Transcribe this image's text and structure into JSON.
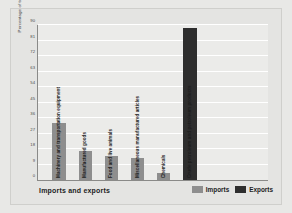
{
  "chart_data": {
    "type": "bar",
    "title": "",
    "xlabel": "Imports and exports",
    "ylabel": "Percentage of total",
    "ylim": [
      0,
      90
    ],
    "yticks": [
      0,
      9,
      18,
      27,
      36,
      45,
      54,
      63,
      72,
      81,
      90
    ],
    "grid": true,
    "legend_position": "bottom-right",
    "legend": [
      "Imports",
      "Exports"
    ],
    "categories": [
      "Machinery and transportation equipment",
      "Manufactured goods",
      "Food and live animals",
      "Miscellaneous manufactured articles",
      "Chemicals",
      "Crude petroleum and petroleum products"
    ],
    "values": [
      33,
      17,
      14,
      13,
      4,
      88
    ],
    "series_of_bar": [
      "Imports",
      "Imports",
      "Imports",
      "Imports",
      "Imports",
      "Exports"
    ],
    "colors": {
      "imports": "#8e8e8e",
      "exports": "#2e2e2e",
      "plot_background": "#ebebe9",
      "figure_background": "#e4e4e2",
      "gridline": "#ffffff",
      "axis": "#8a8a88"
    }
  }
}
